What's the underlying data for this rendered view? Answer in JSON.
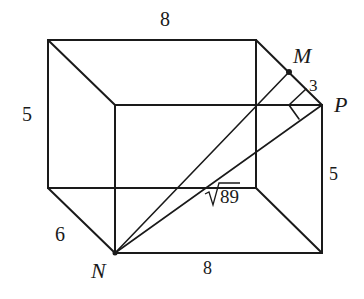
{
  "diagram": {
    "type": "3d-box-geometry",
    "stroke_color": "#1a1a1a",
    "background": "#ffffff",
    "labels": {
      "top_edge": "8",
      "left_edge": "5",
      "right_edge": "5",
      "depth_edge": "6",
      "bottom_edge": "8",
      "mp_segment": "3",
      "diagonal": "√89",
      "diagonal_radicand": "89",
      "point_m": "M",
      "point_n": "N",
      "point_p": "P"
    },
    "points": {
      "back_top_left": [
        48,
        40
      ],
      "back_top_right": [
        256,
        40
      ],
      "front_top_left": [
        115,
        105
      ],
      "front_top_right_P": [
        322,
        105
      ],
      "back_bottom_left": [
        48,
        188
      ],
      "back_bottom_right": [
        256,
        188
      ],
      "front_bottom_left_N": [
        115,
        253
      ],
      "front_bottom_right": [
        322,
        253
      ],
      "M": [
        289,
        72
      ]
    }
  }
}
